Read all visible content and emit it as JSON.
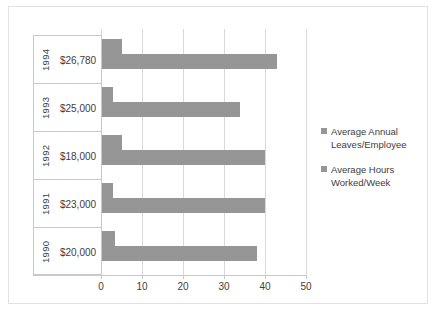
{
  "chart_data": {
    "type": "bar",
    "orientation": "horizontal",
    "title": "",
    "xlabel": "",
    "ylabel": "",
    "xlim": [
      0,
      50
    ],
    "xticks": [
      "0",
      "10",
      "20",
      "30",
      "40",
      "50"
    ],
    "grid": true,
    "legend_position": "right",
    "categories": [
      "1994",
      "1993",
      "1992",
      "1991",
      "1990"
    ],
    "category_values": [
      "$26,780",
      "$25,000",
      "$18,000",
      "$23,000",
      "$20,000"
    ],
    "series": [
      {
        "name": "Average Annual Leaves/Employee",
        "values": [
          5,
          3,
          5,
          3,
          3.5
        ]
      },
      {
        "name": "Average Hours Worked/Week",
        "values": [
          43,
          34,
          40,
          40,
          38
        ]
      }
    ],
    "rows": [
      {
        "year": "1994",
        "salary": "$26,780",
        "leaves": 5,
        "hours": 43
      },
      {
        "year": "1993",
        "salary": "$25,000",
        "leaves": 3,
        "hours": 34
      },
      {
        "year": "1992",
        "salary": "$18,000",
        "leaves": 5,
        "hours": 40
      },
      {
        "year": "1991",
        "salary": "$23,000",
        "leaves": 3,
        "hours": 40
      },
      {
        "year": "1990",
        "salary": "$20,000",
        "leaves": 3.5,
        "hours": 38
      }
    ],
    "colors": {
      "bar": "#969696",
      "gridline": "#d9d9d9",
      "axis": "#c9c9c9",
      "text": "#3d3d3d",
      "background": "#ffffff"
    }
  },
  "legend": {
    "items": [
      {
        "label_line1": "Average Annual",
        "label_line2": "Leaves/Employee"
      },
      {
        "label_line1": "Average Hours",
        "label_line2": "Worked/Week"
      }
    ]
  },
  "axis": {
    "ticks": [
      "0",
      "10",
      "20",
      "30",
      "40",
      "50"
    ]
  }
}
